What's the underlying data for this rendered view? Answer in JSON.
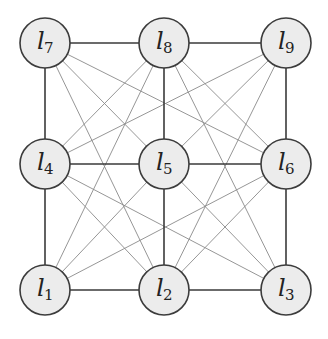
{
  "figure": {
    "type": "graph",
    "nodes": [
      {
        "id": "l7",
        "label": "l",
        "sub": "7",
        "cx": 45,
        "cy": 43
      },
      {
        "id": "l8",
        "label": "l",
        "sub": "8",
        "cx": 164,
        "cy": 43
      },
      {
        "id": "l9",
        "label": "l",
        "sub": "9",
        "cx": 286,
        "cy": 43
      },
      {
        "id": "l4",
        "label": "l",
        "sub": "4",
        "cx": 45,
        "cy": 164
      },
      {
        "id": "l5",
        "label": "l",
        "sub": "5",
        "cx": 164,
        "cy": 164
      },
      {
        "id": "l6",
        "label": "l",
        "sub": "6",
        "cx": 286,
        "cy": 164
      },
      {
        "id": "l1",
        "label": "l",
        "sub": "1",
        "cx": 45,
        "cy": 290
      },
      {
        "id": "l2",
        "label": "l",
        "sub": "2",
        "cx": 164,
        "cy": 290
      },
      {
        "id": "l3",
        "label": "l",
        "sub": "3",
        "cx": 286,
        "cy": 290
      }
    ],
    "grid_edges": [
      [
        "l7",
        "l8"
      ],
      [
        "l8",
        "l9"
      ],
      [
        "l4",
        "l5"
      ],
      [
        "l5",
        "l6"
      ],
      [
        "l1",
        "l2"
      ],
      [
        "l2",
        "l3"
      ],
      [
        "l7",
        "l4"
      ],
      [
        "l4",
        "l1"
      ],
      [
        "l8",
        "l5"
      ],
      [
        "l5",
        "l2"
      ],
      [
        "l9",
        "l6"
      ],
      [
        "l6",
        "l3"
      ]
    ],
    "thin_edges": [
      [
        "l7",
        "l5"
      ],
      [
        "l8",
        "l4"
      ],
      [
        "l8",
        "l6"
      ],
      [
        "l9",
        "l5"
      ],
      [
        "l4",
        "l2"
      ],
      [
        "l5",
        "l1"
      ],
      [
        "l5",
        "l3"
      ],
      [
        "l6",
        "l2"
      ],
      [
        "l7",
        "l6"
      ],
      [
        "l7",
        "l2"
      ],
      [
        "l8",
        "l1"
      ],
      [
        "l8",
        "l3"
      ],
      [
        "l9",
        "l4"
      ],
      [
        "l9",
        "l2"
      ],
      [
        "l4",
        "l3"
      ],
      [
        "l6",
        "l1"
      ]
    ],
    "node_radius": 25,
    "colors": {
      "node_fill": "#ececec",
      "node_stroke": "#3c3c3c",
      "grid_edge": "#3a3a3a",
      "thin_edge": "#8a8a8a"
    }
  },
  "caption": {
    "text": "(truncated caption text, cut off at image edge)"
  }
}
